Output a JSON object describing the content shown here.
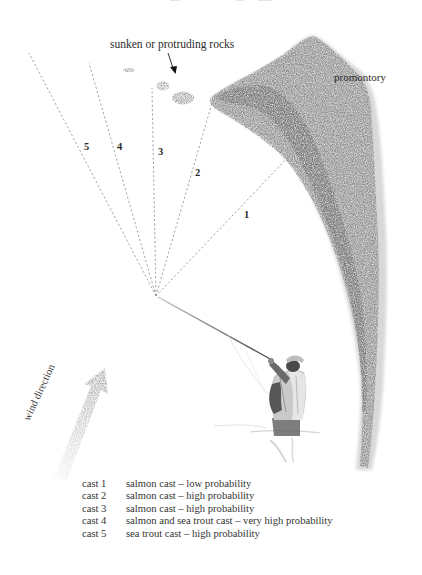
{
  "diagram": {
    "type": "fly-fishing cast diagram",
    "labels": {
      "rocks": "sunken or protruding rocks",
      "promontory": "promontory",
      "wind": "wind direction"
    },
    "origin": {
      "x": 156,
      "y": 296
    },
    "casts": [
      {
        "id": 1,
        "label": "1",
        "end": {
          "x": 290,
          "y": 155
        },
        "label_pos": {
          "x": 244,
          "y": 210
        }
      },
      {
        "id": 2,
        "label": "2",
        "end": {
          "x": 212,
          "y": 103
        },
        "label_pos": {
          "x": 195,
          "y": 168
        }
      },
      {
        "id": 3,
        "label": "3",
        "end": {
          "x": 152,
          "y": 88
        },
        "label_pos": {
          "x": 158,
          "y": 147
        }
      },
      {
        "id": 4,
        "label": "4",
        "end": {
          "x": 89,
          "y": 63
        },
        "label_pos": {
          "x": 117,
          "y": 142
        }
      },
      {
        "id": 5,
        "label": "5",
        "end": {
          "x": 29,
          "y": 53
        },
        "label_pos": {
          "x": 84,
          "y": 142
        }
      }
    ],
    "colors": {
      "land": "#8a8a8a",
      "rock": "#8f8f8f",
      "dash": "#9a9a9a",
      "arrow": "#a6a6a6",
      "text": "#2b2b2b"
    }
  },
  "legend": {
    "items": [
      {
        "cast": "cast 1",
        "description": "salmon cast – low probability"
      },
      {
        "cast": "cast 2",
        "description": "salmon cast – high probability"
      },
      {
        "cast": "cast 3",
        "description": "salmon cast – high probability"
      },
      {
        "cast": "cast 4",
        "description": "salmon and sea trout cast – very high probability"
      },
      {
        "cast": "cast 5",
        "description": "sea trout cast – high probability"
      }
    ]
  }
}
